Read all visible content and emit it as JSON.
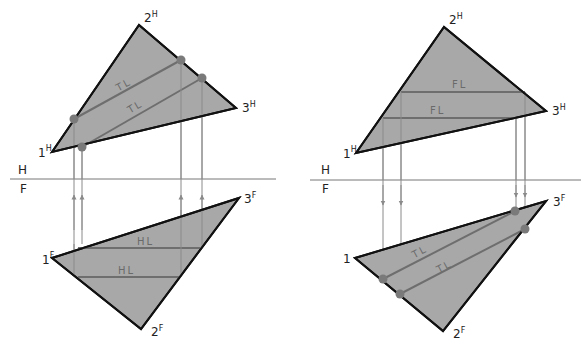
{
  "figure": {
    "left": {
      "fold_line": {
        "top_label": "H",
        "bottom_label": "F"
      },
      "top_view": {
        "vertices": [
          {
            "num": "1",
            "sup": "H"
          },
          {
            "num": "2",
            "sup": "H"
          },
          {
            "num": "3",
            "sup": "H"
          }
        ],
        "lines": [
          {
            "label": "TL"
          },
          {
            "label": "TL"
          }
        ]
      },
      "front_view": {
        "vertices": [
          {
            "num": "1",
            "sup": "F"
          },
          {
            "num": "2",
            "sup": "F"
          },
          {
            "num": "3",
            "sup": "F"
          }
        ],
        "lines": [
          {
            "label": "HL"
          },
          {
            "label": "HL"
          }
        ]
      },
      "projector_direction": "up"
    },
    "right": {
      "fold_line": {
        "top_label": "H",
        "bottom_label": "F"
      },
      "top_view": {
        "vertices": [
          {
            "num": "1",
            "sup": "H"
          },
          {
            "num": "2",
            "sup": "H"
          },
          {
            "num": "3",
            "sup": "H"
          }
        ],
        "lines": [
          {
            "label": "FL"
          },
          {
            "label": "FL"
          }
        ]
      },
      "front_view": {
        "vertices": [
          {
            "num": "1",
            "sup": ""
          },
          {
            "num": "2",
            "sup": "F"
          },
          {
            "num": "3",
            "sup": "F"
          }
        ],
        "lines": [
          {
            "label": "TL"
          },
          {
            "label": "TL"
          }
        ]
      },
      "projector_direction": "down"
    },
    "colors": {
      "plane_fill": "#a8a8a8",
      "edge": "#111111",
      "construction_line": "#6e6e6e",
      "projector": "#8a8a8a",
      "point_marker": "#7a7a7a"
    }
  }
}
